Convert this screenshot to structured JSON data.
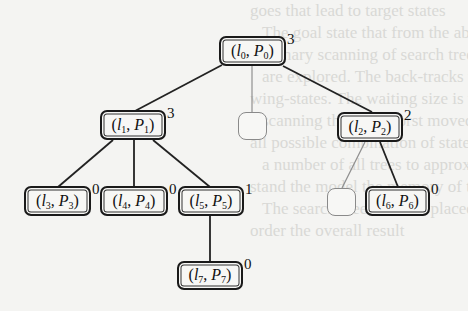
{
  "diagram": {
    "type": "tree",
    "nodes": [
      {
        "id": "n0",
        "l": "l",
        "li": "0",
        "p": "P",
        "pi": "0",
        "badge": "3",
        "x": 219,
        "y": 36,
        "w": 67,
        "h": 30
      },
      {
        "id": "n1",
        "l": "l",
        "li": "1",
        "p": "P",
        "pi": "1",
        "badge": "3",
        "x": 100,
        "y": 110,
        "w": 66,
        "h": 30
      },
      {
        "id": "e1",
        "empty": true,
        "x": 238,
        "y": 112,
        "w": 29,
        "h": 28
      },
      {
        "id": "n2",
        "l": "l",
        "li": "2",
        "p": "P",
        "pi": "2",
        "badge": "2",
        "x": 337,
        "y": 112,
        "w": 66,
        "h": 30
      },
      {
        "id": "n3",
        "l": "l",
        "li": "3",
        "p": "P",
        "pi": "3",
        "badge": "0",
        "x": 24,
        "y": 186,
        "w": 67,
        "h": 30
      },
      {
        "id": "n4",
        "l": "l",
        "li": "4",
        "p": "P",
        "pi": "4",
        "badge": "0",
        "x": 100,
        "y": 186,
        "w": 68,
        "h": 30
      },
      {
        "id": "n5",
        "l": "l",
        "li": "5",
        "p": "P",
        "pi": "5",
        "badge": "1",
        "x": 178,
        "y": 186,
        "w": 66,
        "h": 30
      },
      {
        "id": "e2",
        "empty": true,
        "x": 327,
        "y": 188,
        "w": 29,
        "h": 28
      },
      {
        "id": "n6",
        "l": "l",
        "li": "6",
        "p": "P",
        "pi": "6",
        "badge": "0",
        "x": 365,
        "y": 186,
        "w": 65,
        "h": 30
      },
      {
        "id": "n7",
        "l": "l",
        "li": "7",
        "p": "P",
        "pi": "7",
        "badge": "0",
        "x": 177,
        "y": 261,
        "w": 66,
        "h": 29
      }
    ],
    "edges": [
      {
        "from": "n0",
        "to": "n1",
        "x1": 222,
        "y1": 65,
        "x2": 135,
        "y2": 111,
        "style": "solid"
      },
      {
        "from": "n0",
        "to": "e1",
        "x1": 252,
        "y1": 66,
        "x2": 252,
        "y2": 112,
        "style": "faint"
      },
      {
        "from": "n0",
        "to": "n2",
        "x1": 283,
        "y1": 66,
        "x2": 372,
        "y2": 112,
        "style": "solid"
      },
      {
        "from": "n1",
        "to": "n3",
        "x1": 113,
        "y1": 140,
        "x2": 58,
        "y2": 187,
        "style": "solid"
      },
      {
        "from": "n1",
        "to": "n4",
        "x1": 134,
        "y1": 140,
        "x2": 134,
        "y2": 187,
        "style": "solid"
      },
      {
        "from": "n1",
        "to": "n5",
        "x1": 153,
        "y1": 140,
        "x2": 210,
        "y2": 187,
        "style": "solid"
      },
      {
        "from": "n2",
        "to": "e2",
        "x1": 365,
        "y1": 142,
        "x2": 342,
        "y2": 188,
        "style": "faint"
      },
      {
        "from": "n2",
        "to": "n6",
        "x1": 380,
        "y1": 142,
        "x2": 398,
        "y2": 187,
        "style": "solid"
      },
      {
        "from": "n5",
        "to": "n7",
        "x1": 210,
        "y1": 216,
        "x2": 210,
        "y2": 262,
        "style": "solid"
      }
    ]
  },
  "background_bleed_lines": [
    "goes that lead to target states",
    "The goal state that from the above",
    "summary scanning of search tree, each",
    "are explored. The back-tracks that the",
    "wing-states. The waiting size is the",
    "scanning the next worst moved states, at",
    "all possible combination of states in",
    "a number of all trees to approximate",
    "stand the model the memory of the working",
    "The search-tree answers placed with",
    "order the overall result"
  ]
}
